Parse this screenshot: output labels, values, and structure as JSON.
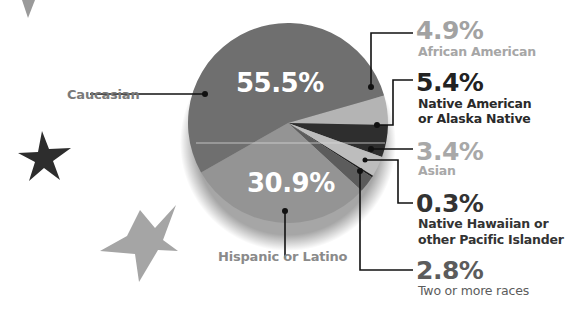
{
  "chart_data": {
    "type": "pie",
    "title": "",
    "slices": [
      {
        "label": "Caucasian",
        "value": 55.5,
        "display": "55.5%",
        "color": "#6f6f6f"
      },
      {
        "label": "African American",
        "value": 4.9,
        "display": "4.9%",
        "color": "#b4b4b4"
      },
      {
        "label": "Native American or Alaska Native",
        "value": 5.4,
        "display": "5.4%",
        "color": "#2e2e2e"
      },
      {
        "label": "Asian",
        "value": 3.4,
        "display": "3.4%",
        "color": "#bdbdbd"
      },
      {
        "label": "Native Hawaiian or other Pacific Islander",
        "value": 0.3,
        "display": "0.3%",
        "color": "#1e1e1e"
      },
      {
        "label": "Two or more races",
        "value": 2.8,
        "display": "2.8%",
        "color": "#5c5c5c"
      },
      {
        "label": "Hispanic or Latino",
        "value": 30.9,
        "display": "30.9%",
        "color": "#949494"
      }
    ],
    "legend": "none (callout labels)"
  },
  "labels": {
    "caucasian": {
      "name": "Caucasian",
      "pct": "55.5%"
    },
    "hispanic": {
      "name": "Hispanic or Latino",
      "pct": "30.9%"
    },
    "african": {
      "name": "African American",
      "pct": "4.9%"
    },
    "native_am": {
      "line1": "Native American",
      "line2": "or Alaska Native",
      "pct": "5.4%"
    },
    "asian": {
      "name": "Asian",
      "pct": "3.4%"
    },
    "hawaiian": {
      "line1": "Native Hawaiian or",
      "line2": "other Pacific Islander",
      "pct": "0.3%"
    },
    "two_more": {
      "name": "Two or more races",
      "pct": "2.8%"
    }
  },
  "colors": {
    "text_light": "#9a9a9a",
    "text_dark": "#333333",
    "text_mid": "#5a5a5a",
    "leader": "#111111"
  }
}
